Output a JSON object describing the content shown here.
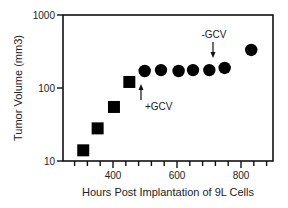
{
  "chart_data": {
    "type": "scatter",
    "title": "",
    "xlabel": "Hours Post Implantation of 9L Cells",
    "ylabel": "Tumor Volume (mm3)",
    "yscale": "log",
    "xlim": [
      245,
      900
    ],
    "ylim": [
      10,
      1000
    ],
    "x_ticks": [
      400,
      600,
      800
    ],
    "y_ticks": [
      10,
      100,
      1000
    ],
    "x_minor_tick_step": 40,
    "grid": false,
    "legend": null,
    "series": [
      {
        "name": "squares",
        "marker": "square",
        "color": "#000000",
        "points": [
          {
            "x": 307,
            "y": 14
          },
          {
            "x": 352,
            "y": 28
          },
          {
            "x": 403,
            "y": 55
          },
          {
            "x": 451,
            "y": 121
          }
        ]
      },
      {
        "name": "circles",
        "marker": "circle",
        "color": "#000000",
        "points": [
          {
            "x": 499,
            "y": 171
          },
          {
            "x": 550,
            "y": 176
          },
          {
            "x": 605,
            "y": 171
          },
          {
            "x": 650,
            "y": 176
          },
          {
            "x": 701,
            "y": 176
          },
          {
            "x": 749,
            "y": 188
          },
          {
            "x": 832,
            "y": 332
          }
        ]
      }
    ],
    "annotations": [
      {
        "text": "+GCV",
        "x": 490,
        "arrow": "up",
        "position": "below"
      },
      {
        "text": "-GCV",
        "x": 720,
        "arrow": "down",
        "position": "above"
      }
    ]
  },
  "labels": {
    "x_title": "Hours Post Implantation of 9L Cells",
    "y_title": "Tumor Volume (mm3)",
    "y_tick_1000": "1000",
    "y_tick_100": "100",
    "y_tick_10": "10",
    "x_tick_400": "400",
    "x_tick_600": "600",
    "x_tick_800": "800",
    "annot_plus": "+GCV",
    "annot_minus": "-GCV"
  }
}
